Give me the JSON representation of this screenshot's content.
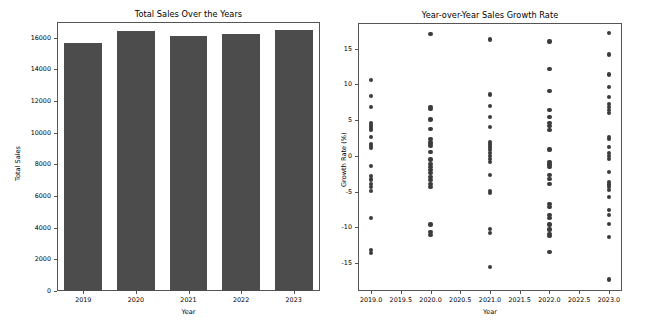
{
  "figure": {
    "width": 651,
    "height": 334,
    "background": "#ffffff",
    "bar_color": "#4c4c4c",
    "dot_color": "#3b3b3b",
    "axis_color": "#555555"
  },
  "caption": {
    "text": ""
  },
  "chart_data": [
    {
      "type": "bar",
      "id": "total-sales-bar",
      "title": "Total Sales Over the Years",
      "xlabel": "Year",
      "ylabel": "Total Sales",
      "categories": [
        "2019",
        "2020",
        "2021",
        "2022",
        "2023"
      ],
      "values": [
        15680,
        16400,
        16120,
        16230,
        16500
      ],
      "ylim": [
        0,
        17000
      ],
      "ytick_labels": [
        "0",
        "2000",
        "4000",
        "6000",
        "8000",
        "10000",
        "12000",
        "14000",
        "16000"
      ],
      "ytick_values": [
        0,
        2000,
        4000,
        6000,
        8000,
        10000,
        12000,
        14000,
        16000
      ],
      "grid": false,
      "legend": "none"
    },
    {
      "type": "scatter",
      "id": "growth-rate-scatter",
      "title": "Year-over-Year Sales Growth Rate",
      "xlabel": "Year",
      "ylabel": "Growth Rate (%)",
      "xlim": [
        2018.78,
        2023.22
      ],
      "ylim": [
        -18.9,
        18.6
      ],
      "xtick_labels": [
        "2019.0",
        "2019.5",
        "2020.0",
        "2020.5",
        "2021.0",
        "2021.5",
        "2022.0",
        "2022.5",
        "2023.0"
      ],
      "xtick_values": [
        2019.0,
        2019.5,
        2020.0,
        2020.5,
        2021.0,
        2021.5,
        2022.0,
        2022.5,
        2023.0
      ],
      "ytick_labels": [
        "-15",
        "-10",
        "-5",
        "0",
        "5",
        "10",
        "15"
      ],
      "ytick_values": [
        -15,
        -10,
        -5,
        0,
        5,
        10,
        15
      ],
      "grid": false,
      "legend": "none",
      "series": [
        {
          "name": "2019",
          "x": 2019,
          "values": [
            10.6,
            8.4,
            6.8,
            4.6,
            4.3,
            4.0,
            3.7,
            2.6,
            1.7,
            1.4,
            1.1,
            -1.4,
            -2.8,
            -3.3,
            -3.9,
            -4.4,
            -4.9,
            -8.7,
            -13.2,
            -13.6
          ]
        },
        {
          "name": "2020",
          "x": 2020,
          "values": [
            17.1,
            6.9,
            6.6,
            5.1,
            3.8,
            2.4,
            2.0,
            1.7,
            1.4,
            0.6,
            -0.5,
            -1.1,
            -1.6,
            -2.0,
            -2.4,
            -3.0,
            -3.4,
            -3.9,
            -4.4,
            -9.6,
            -10.7,
            -11.1
          ]
        },
        {
          "name": "2021",
          "x": 2021,
          "values": [
            16.3,
            8.6,
            7.0,
            5.4,
            4.1,
            2.0,
            1.7,
            1.4,
            1.1,
            0.8,
            0.4,
            0.0,
            -0.4,
            -0.9,
            -2.7,
            -4.9,
            -5.2,
            -10.2,
            -10.8,
            -15.5
          ]
        },
        {
          "name": "2022",
          "x": 2022,
          "values": [
            16.0,
            12.2,
            9.1,
            6.4,
            5.4,
            4.6,
            4.2,
            3.6,
            0.9,
            -0.8,
            -1.2,
            -1.6,
            -2.7,
            -3.2,
            -3.9,
            -6.7,
            -7.1,
            -8.3,
            -8.7,
            -9.6,
            -10.3,
            -10.9,
            -11.2,
            -13.4
          ]
        },
        {
          "name": "2023",
          "x": 2023,
          "values": [
            17.2,
            14.2,
            11.4,
            9.6,
            8.3,
            7.3,
            6.8,
            6.4,
            6.0,
            2.7,
            2.4,
            1.2,
            0.4,
            0.0,
            -0.4,
            -2.3,
            -3.6,
            -4.0,
            -4.4,
            -4.8,
            -5.7,
            -7.6,
            -8.3,
            -9.5,
            -11.4,
            -17.3
          ]
        }
      ]
    }
  ]
}
